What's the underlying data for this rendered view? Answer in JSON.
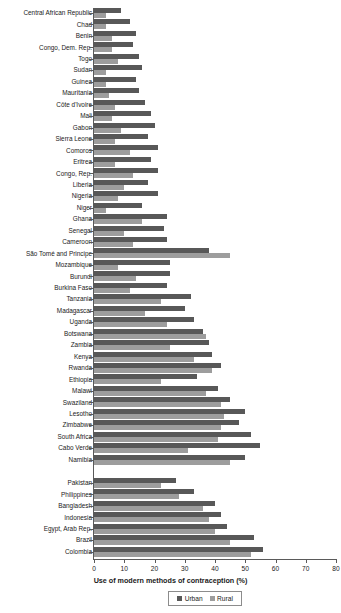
{
  "chart_data": {
    "type": "bar",
    "orientation": "horizontal",
    "title": "",
    "xlabel": "Use of modern methods of contraception (%)",
    "ylabel": "",
    "xlim": [
      0,
      80
    ],
    "xticks": [
      0,
      10,
      20,
      30,
      40,
      50,
      60,
      70,
      80
    ],
    "grid": false,
    "legend_position": "bottom",
    "colors": {
      "urban": "#585858",
      "rural": "#9d9d9d"
    },
    "legend": [
      "Urban",
      "Rural"
    ],
    "categories": [
      "Central African Republic",
      "Chad",
      "Benin",
      "Congo, Dem. Rep.",
      "Togo",
      "Sudan",
      "Guinea",
      "Mauritania",
      "Côte d'Ivoire",
      "Mali",
      "Gabon",
      "Sierra Leone",
      "Comoros",
      "Eritrea",
      "Congo, Rep.",
      "Liberia",
      "Nigeria",
      "Niger",
      "Ghana",
      "Senegal",
      "Cameroon",
      "São Tomé and Principe",
      "Mozambique",
      "Burundi",
      "Burkina Faso",
      "Tanzania",
      "Madagascar",
      "Uganda",
      "Botswana",
      "Zambia",
      "Kenya",
      "Rwanda",
      "Ethiopia",
      "Malawi",
      "Swaziland",
      "Lesotho",
      "Zimbabwe",
      "South Africa",
      "Cabo Verde",
      "Namibia",
      "Pakistan",
      "Philippines",
      "Bangladesh",
      "Indonesia",
      "Egypt, Arab Rep.",
      "Brazil",
      "Colombia"
    ],
    "group_breaks": [
      40
    ],
    "series": [
      {
        "name": "Urban",
        "values": [
          9,
          12,
          14,
          13,
          15,
          16,
          14,
          15,
          17,
          19,
          20,
          18,
          21,
          19,
          21,
          18,
          21,
          16,
          24,
          23,
          24,
          38,
          25,
          25,
          24,
          32,
          30,
          33,
          36,
          38,
          39,
          42,
          34,
          41,
          45,
          50,
          48,
          52,
          55,
          50,
          27,
          33,
          40,
          42,
          44,
          53,
          56
        ]
      },
      {
        "name": "Rural",
        "values": [
          4,
          4,
          6,
          6,
          8,
          4,
          4,
          5,
          7,
          6,
          9,
          7,
          12,
          7,
          13,
          10,
          8,
          4,
          16,
          10,
          13,
          45,
          8,
          14,
          12,
          22,
          17,
          24,
          37,
          25,
          33,
          39,
          22,
          37,
          42,
          43,
          42,
          41,
          31,
          45,
          22,
          28,
          36,
          38,
          40,
          45,
          52
        ]
      }
    ]
  }
}
